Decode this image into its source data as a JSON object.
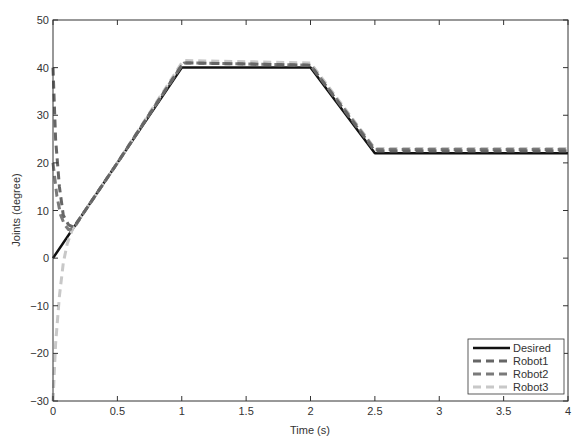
{
  "chart_data": {
    "type": "line",
    "title": "",
    "xlabel": "Time (s)",
    "ylabel": "Joints (degree)",
    "xlim": [
      0,
      4
    ],
    "ylim": [
      -30,
      50
    ],
    "xticks": [
      0,
      0.5,
      1,
      1.5,
      2,
      2.5,
      3,
      3.5,
      4
    ],
    "xtick_labels": [
      "0",
      "0.5",
      "1",
      "1.5",
      "2",
      "2.5",
      "3",
      "3.5",
      "4"
    ],
    "yticks": [
      -30,
      -20,
      -10,
      0,
      10,
      20,
      30,
      40,
      50
    ],
    "ytick_labels": [
      "-30",
      "-20",
      "-10",
      "0",
      "10",
      "20",
      "30",
      "40",
      "50"
    ],
    "grid": false,
    "legend_position": "lower right",
    "series": [
      {
        "name": "Desired",
        "color": "#111111",
        "style": "solid",
        "width": 2.5,
        "x": [
          0,
          1,
          2,
          2.5,
          4
        ],
        "y": [
          0,
          40,
          40,
          22,
          22
        ]
      },
      {
        "name": "Robot1",
        "color": "#666666",
        "style": "dashed",
        "width": 3,
        "x": [
          0,
          0.02,
          0.05,
          0.08,
          0.12,
          0.16,
          0.25,
          0.5,
          1,
          1.02,
          2,
          2.5,
          4
        ],
        "y": [
          40,
          25,
          15,
          9,
          7,
          6.5,
          10,
          20,
          40.5,
          41,
          40.5,
          22.5,
          22.5
        ]
      },
      {
        "name": "Robot2",
        "color": "#7a7a7a",
        "style": "dashed",
        "width": 3,
        "x": [
          0,
          0.03,
          0.06,
          0.09,
          0.12,
          0.16,
          0.25,
          0.5,
          1,
          1.02,
          2,
          2.5,
          4
        ],
        "y": [
          20,
          13,
          9,
          7,
          6,
          6.2,
          10,
          20,
          40.5,
          41,
          40.5,
          22.8,
          22.8
        ]
      },
      {
        "name": "Robot3",
        "color": "#c8c8c8",
        "style": "dashed",
        "width": 3,
        "x": [
          0,
          0.02,
          0.05,
          0.08,
          0.11,
          0.15,
          0.25,
          0.5,
          1,
          1.02,
          2,
          2.5,
          4
        ],
        "y": [
          -30,
          -18,
          -8,
          -1,
          3,
          6,
          10,
          20,
          41,
          41.5,
          41,
          23,
          23
        ]
      }
    ]
  }
}
